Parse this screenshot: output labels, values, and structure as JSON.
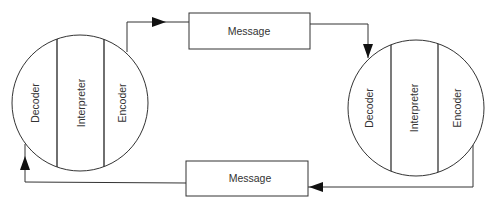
{
  "diagram": {
    "type": "communication-model",
    "nodes": [
      {
        "id": "communicator-left",
        "sections": [
          "Decoder",
          "Interpreter",
          "Encoder"
        ]
      },
      {
        "id": "communicator-right",
        "sections": [
          "Decoder",
          "Interpreter",
          "Encoder"
        ]
      }
    ],
    "messages": [
      {
        "id": "message-top",
        "label": "Message",
        "from": "communicator-left.Encoder",
        "to": "communicator-right.Decoder"
      },
      {
        "id": "message-bottom",
        "label": "Message",
        "from": "communicator-right.Encoder",
        "to": "communicator-left.Decoder"
      }
    ],
    "colors": {
      "stroke": "#333333",
      "background": "#ffffff"
    }
  }
}
